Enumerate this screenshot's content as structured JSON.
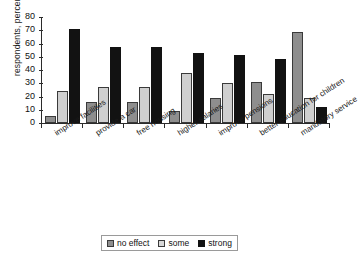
{
  "chart_data": {
    "type": "bar",
    "title": "",
    "xlabel": "",
    "ylabel": "respondents, percent",
    "ylim": [
      0,
      80
    ],
    "ytick_step": 10,
    "yticks": [
      80,
      70,
      60,
      50,
      40,
      30,
      20,
      10,
      0
    ],
    "grid": false,
    "legend_position": "bottom-center",
    "categories": [
      "improve facilities",
      "provide a car",
      "free housing",
      "higher salaries",
      "improve pensions",
      "better education for children",
      "mandatory service"
    ],
    "series": [
      {
        "name": "no effect",
        "color": "#8e8e8e",
        "values": [
          5,
          16,
          16,
          9,
          19,
          31,
          69
        ]
      },
      {
        "name": "some",
        "color": "#cfcfcf",
        "values": [
          24,
          27,
          27,
          38,
          30,
          22,
          19
        ]
      },
      {
        "name": "strong",
        "color": "#121212",
        "values": [
          71,
          57,
          57,
          53,
          51,
          48,
          12
        ]
      }
    ]
  },
  "legend": {
    "items": [
      {
        "label": "no effect"
      },
      {
        "label": "some"
      },
      {
        "label": "strong"
      }
    ]
  }
}
